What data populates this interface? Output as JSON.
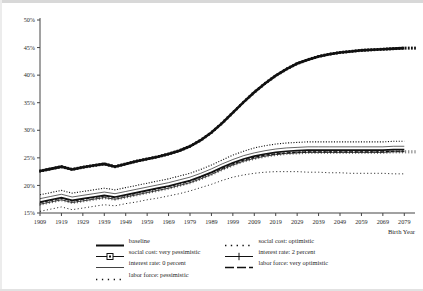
{
  "chart_data": {
    "type": "line",
    "title": "",
    "xlabel": "Birth Year",
    "ylabel": "",
    "xlim": [
      1909,
      2084
    ],
    "ylim": [
      15,
      50
    ],
    "grid": false,
    "legend_position": "bottom",
    "ytick_labels": [
      "15%",
      "20%",
      "25%",
      "30%",
      "35%",
      "40%",
      "45%",
      "50%"
    ],
    "ytick_values": [
      15,
      20,
      25,
      30,
      35,
      40,
      45,
      50
    ],
    "xtick_labels": [
      "1909",
      "1919",
      "1929",
      "1939",
      "1949",
      "1959",
      "1969",
      "1979",
      "1989",
      "1999",
      "2009",
      "2019",
      "2029",
      "2039",
      "2049",
      "2059",
      "2069",
      "2079"
    ],
    "xtick_values": [
      1909,
      1919,
      1929,
      1939,
      1949,
      1959,
      1969,
      1979,
      1989,
      1999,
      2009,
      2019,
      2029,
      2039,
      2049,
      2059,
      2069,
      2079
    ],
    "x": [
      1909,
      1914,
      1919,
      1924,
      1929,
      1934,
      1939,
      1944,
      1949,
      1954,
      1959,
      1964,
      1969,
      1974,
      1979,
      1984,
      1989,
      1994,
      1999,
      2004,
      2009,
      2014,
      2019,
      2024,
      2029,
      2034,
      2039,
      2044,
      2049,
      2054,
      2059,
      2064,
      2069,
      2074,
      2079
    ],
    "series": [
      {
        "name": "social cost: very pessimistic",
        "style": "line-marker-square",
        "values": [
          22.6,
          23.0,
          23.4,
          22.9,
          23.3,
          23.6,
          23.9,
          23.4,
          23.9,
          24.4,
          24.8,
          25.2,
          25.7,
          26.3,
          27.1,
          28.2,
          29.6,
          31.3,
          33.2,
          35.1,
          36.9,
          38.5,
          39.9,
          41.1,
          42.1,
          42.8,
          43.4,
          43.8,
          44.1,
          44.3,
          44.5,
          44.6,
          44.7,
          44.8,
          44.9
        ]
      },
      {
        "name": "social cost: optimistic",
        "style": "dotted",
        "values": [
          18.3,
          18.7,
          19.1,
          18.6,
          18.9,
          19.2,
          19.5,
          19.2,
          19.6,
          20.0,
          20.4,
          20.8,
          21.2,
          21.7,
          22.2,
          22.9,
          23.7,
          24.6,
          25.5,
          26.2,
          26.8,
          27.2,
          27.5,
          27.7,
          27.8,
          27.9,
          27.9,
          27.9,
          27.9,
          27.9,
          27.9,
          27.9,
          27.9,
          28.0,
          28.0
        ]
      },
      {
        "name": "interest rate: 0 percent",
        "style": "thin-line",
        "values": [
          17.6,
          18.0,
          18.4,
          17.9,
          18.2,
          18.5,
          18.8,
          18.5,
          18.9,
          19.3,
          19.7,
          20.1,
          20.5,
          21.0,
          21.5,
          22.2,
          23.0,
          23.9,
          24.7,
          25.4,
          25.9,
          26.3,
          26.6,
          26.8,
          26.9,
          27.0,
          27.0,
          27.0,
          27.0,
          27.0,
          27.0,
          27.0,
          27.0,
          27.1,
          27.1
        ]
      },
      {
        "name": "interest rate: 2 percent",
        "style": "line-plus",
        "values": [
          16.6,
          17.0,
          17.4,
          16.9,
          17.2,
          17.5,
          17.8,
          17.5,
          17.9,
          18.3,
          18.7,
          19.1,
          19.5,
          20.0,
          20.5,
          21.2,
          22.0,
          22.9,
          23.7,
          24.4,
          24.9,
          25.3,
          25.6,
          25.8,
          25.9,
          26.0,
          26.0,
          26.0,
          26.0,
          26.0,
          26.0,
          26.0,
          26.0,
          26.1,
          26.1
        ]
      },
      {
        "name": "baseline",
        "style": "thick-line",
        "values": [
          17.0,
          17.4,
          17.8,
          17.3,
          17.6,
          17.9,
          18.2,
          17.9,
          18.3,
          18.7,
          19.1,
          19.5,
          19.9,
          20.4,
          20.9,
          21.6,
          22.4,
          23.3,
          24.1,
          24.8,
          25.3,
          25.7,
          26.0,
          26.2,
          26.3,
          26.4,
          26.4,
          26.4,
          26.4,
          26.4,
          26.4,
          26.4,
          26.4,
          26.5,
          26.5
        ]
      },
      {
        "name": "labor force: very optimistic",
        "style": "dashed",
        "values": [
          16.9,
          17.3,
          17.7,
          17.2,
          17.5,
          17.8,
          18.1,
          17.8,
          18.2,
          18.6,
          19.0,
          19.4,
          19.8,
          20.3,
          20.8,
          21.5,
          22.3,
          23.1,
          23.9,
          24.6,
          25.1,
          25.5,
          25.7,
          25.9,
          26.0,
          26.1,
          26.1,
          26.1,
          26.1,
          26.1,
          26.1,
          26.1,
          26.1,
          26.2,
          26.2
        ]
      },
      {
        "name": "labor force: pessimistic",
        "style": "sparse-dotted",
        "values": [
          15.3,
          15.7,
          16.1,
          15.6,
          15.9,
          16.2,
          16.5,
          16.3,
          16.7,
          17.0,
          17.4,
          17.7,
          18.1,
          18.5,
          19.0,
          19.6,
          20.2,
          20.9,
          21.5,
          21.9,
          22.2,
          22.4,
          22.5,
          22.5,
          22.5,
          22.4,
          22.4,
          22.3,
          22.3,
          22.2,
          22.2,
          22.2,
          22.2,
          22.1,
          22.1
        ]
      }
    ]
  },
  "legend": {
    "columns": [
      [
        {
          "label": "baseline",
          "key": "thick-line"
        },
        {
          "label": "social cost: very pessimistic",
          "key": "line-marker-square"
        },
        {
          "label": "interest rate: 0 percent",
          "key": "thin-line"
        },
        {
          "label": "labor force: pessimistic",
          "key": "sparse-dotted"
        }
      ],
      [
        {
          "label": "social cost: optimistic",
          "key": "dotted"
        },
        {
          "label": "interest rate: 2 percent",
          "key": "line-plus"
        },
        {
          "label": "labor force: very optimistic",
          "key": "dashed"
        }
      ]
    ]
  },
  "colors": {
    "axis": "#444444",
    "series": "#111111",
    "background": "#ffffff"
  }
}
